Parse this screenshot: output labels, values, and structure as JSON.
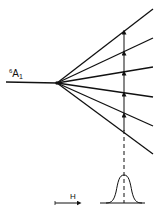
{
  "diagram": {
    "state_label": {
      "superscript": "6",
      "letter": "A",
      "subscript": "1"
    },
    "field_label": "H",
    "colors": {
      "line": "#111111",
      "background": "#ffffff"
    },
    "fan_origin": [
      57,
      83
    ],
    "ground_line": {
      "x1": 6,
      "x2": 57,
      "y": 82
    },
    "split_levels": [
      {
        "x2": 153,
        "y2": 9
      },
      {
        "x2": 153,
        "y2": 38
      },
      {
        "x2": 153,
        "y2": 67
      },
      {
        "x2": 153,
        "y2": 97
      },
      {
        "x2": 153,
        "y2": 126
      },
      {
        "x2": 153,
        "y2": 154
      }
    ],
    "transition_x": 124,
    "transition_arrows_y": [
      31,
      52,
      72,
      93,
      114
    ],
    "resonance_peak": {
      "center_x": 124,
      "baseline_y": 203,
      "peak_y": 175
    }
  }
}
